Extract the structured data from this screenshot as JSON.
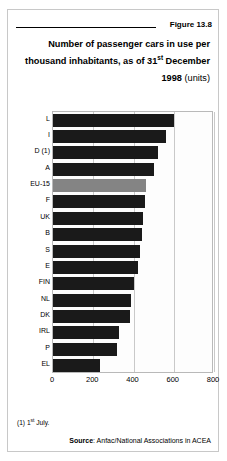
{
  "figure": {
    "label": "Figure 13.8"
  },
  "title": {
    "line1": "Number of passenger cars in use per",
    "line2_a": "thousand inhabitants, as of 31",
    "line2_sup": "st",
    "line2_b": " December",
    "line3_year": "1998",
    "line3_units": " (units)"
  },
  "footnote": {
    "marker": "(1) 1",
    "sup": "st",
    "rest": " July."
  },
  "source": {
    "label": "Source",
    "text": ": Anfac/National Associations in ACEA"
  },
  "colors": {
    "bar": "#1a1a1a",
    "highlight": "#848484",
    "grid": "#c9c9c9",
    "frame": "#b9b9b9"
  },
  "chart_data": {
    "type": "bar",
    "orientation": "horizontal",
    "title": "Number of passenger cars in use per thousand inhabitants, as of 31st December 1998 (units)",
    "xlabel": "",
    "ylabel": "",
    "xlim": [
      0,
      800
    ],
    "xticks": [
      0,
      200,
      400,
      600,
      800
    ],
    "xtick_labels": [
      "0",
      "200",
      "400",
      "600",
      "800"
    ],
    "grid": true,
    "legend": false,
    "highlight_category": "EU-15",
    "categories": [
      "L",
      "I",
      "D (1)",
      "A",
      "EU-15",
      "F",
      "UK",
      "B",
      "S",
      "E",
      "FIN",
      "NL",
      "DK",
      "IRL",
      "P",
      "EL"
    ],
    "values": [
      600,
      560,
      520,
      500,
      460,
      455,
      445,
      440,
      430,
      420,
      400,
      390,
      385,
      330,
      320,
      235
    ]
  }
}
